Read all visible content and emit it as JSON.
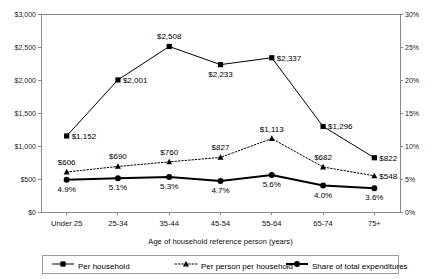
{
  "chart_data": {
    "type": "line",
    "title": "",
    "xlabel": "Age of household reference person (years)",
    "ylabel": "",
    "categories": [
      "Under 25",
      "25-34",
      "35-44",
      "45-54",
      "55-64",
      "65-74",
      "75+"
    ],
    "left_axis": {
      "ticks": [
        "$0",
        "$500",
        "$1,000",
        "$1,500",
        "$2,000",
        "$2,500",
        "$3,000"
      ],
      "values": [
        0,
        500,
        1000,
        1500,
        2000,
        2500,
        3000
      ],
      "ylim": [
        0,
        3000
      ]
    },
    "right_axis": {
      "ticks": [
        "0%",
        "5%",
        "10%",
        "15%",
        "20%",
        "25%",
        "30%"
      ],
      "values": [
        0,
        5,
        10,
        15,
        20,
        25,
        30
      ],
      "ylim": [
        0,
        30
      ]
    },
    "grid": false,
    "legend_position": "bottom",
    "series": [
      {
        "name": "Per household",
        "axis": "left",
        "marker": "square",
        "line": "solid",
        "values": [
          1152,
          2001,
          2508,
          2233,
          2337,
          1296,
          822
        ],
        "labels": [
          "$1,152",
          "$2,001",
          "$2,508",
          "$2,233",
          "$2,337",
          "$1,296",
          "$822"
        ],
        "label_positions": [
          "right",
          "right",
          "above",
          "below",
          "right",
          "right",
          "right"
        ]
      },
      {
        "name": "Per person per household",
        "axis": "left",
        "marker": "triangle",
        "line": "dotted",
        "values": [
          606,
          690,
          760,
          827,
          1113,
          682,
          548
        ],
        "labels": [
          "$606",
          "$690",
          "$760",
          "$827",
          "$1,113",
          "$682",
          "$548"
        ],
        "label_positions": [
          "above",
          "above",
          "above",
          "above",
          "above",
          "above",
          "right"
        ]
      },
      {
        "name": "Share of total expenditures",
        "axis": "right",
        "marker": "circle",
        "line": "thick",
        "values": [
          4.9,
          5.1,
          5.3,
          4.7,
          5.6,
          4.0,
          3.6
        ],
        "labels": [
          "4.9%",
          "5.1%",
          "5.3%",
          "4.7%",
          "5.6%",
          "4.0%",
          "3.6%"
        ],
        "label_positions": [
          "below",
          "below",
          "below",
          "below",
          "below",
          "below",
          "below"
        ]
      }
    ]
  },
  "legend": {
    "items": [
      {
        "label": "Per household"
      },
      {
        "label": "Per person per household"
      },
      {
        "label": "Share of total expenditures"
      }
    ]
  }
}
